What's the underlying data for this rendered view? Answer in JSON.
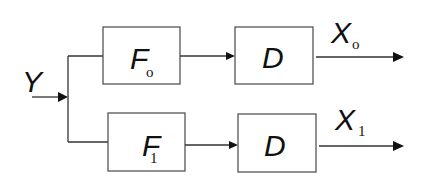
{
  "diagram": {
    "type": "block-diagram",
    "input": {
      "label": "Y"
    },
    "branches": [
      {
        "filter": {
          "label": "F",
          "subscript": "o"
        },
        "block": {
          "label": "D"
        },
        "output": {
          "label": "X",
          "subscript": "o"
        }
      },
      {
        "filter": {
          "label": "F",
          "subscript": "1"
        },
        "block": {
          "label": "D"
        },
        "output": {
          "label": "X",
          "subscript": "1"
        }
      }
    ],
    "colors": {
      "line": "#333333",
      "box_border": "#555555",
      "text": "#111111",
      "background": "#ffffff"
    }
  }
}
